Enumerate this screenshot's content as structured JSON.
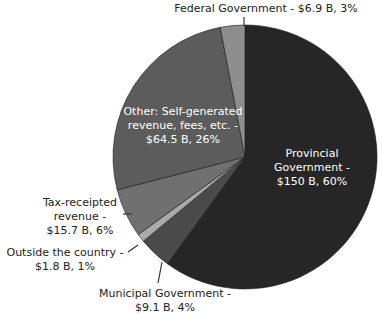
{
  "chart_data": {
    "type": "pie",
    "title": "",
    "start_angle": "12 o'clock, clockwise",
    "categories": [
      "Provincial Government",
      "Municipal Government",
      "Outside the country",
      "Tax-receipted revenue",
      "Other: Self-generated revenue, fees, etc.",
      "Federal Government"
    ],
    "values_billion": [
      150,
      9.1,
      1.8,
      15.7,
      64.5,
      6.9
    ],
    "percentages": [
      60,
      4,
      1,
      6,
      26,
      3
    ],
    "colors": [
      "#262626",
      "#4a4a4a",
      "#ababab",
      "#707070",
      "#5c5c5c",
      "#8e8e8e"
    ]
  },
  "labels": {
    "provincial": [
      "Provincial",
      "Government -",
      "$150 B, 60%"
    ],
    "municipal": [
      "Municipal Government -",
      "$9.1 B, 4%"
    ],
    "outside": [
      "Outside the country -",
      "$1.8 B, 1%"
    ],
    "tax": [
      "Tax-receipted",
      "revenue -",
      "$15.7 B, 6%"
    ],
    "other": [
      "Other: Self-generated",
      "revenue, fees, etc. -",
      "$64.5 B, 26%"
    ],
    "federal": [
      "Federal Government - $6.9 B, 3%"
    ]
  }
}
